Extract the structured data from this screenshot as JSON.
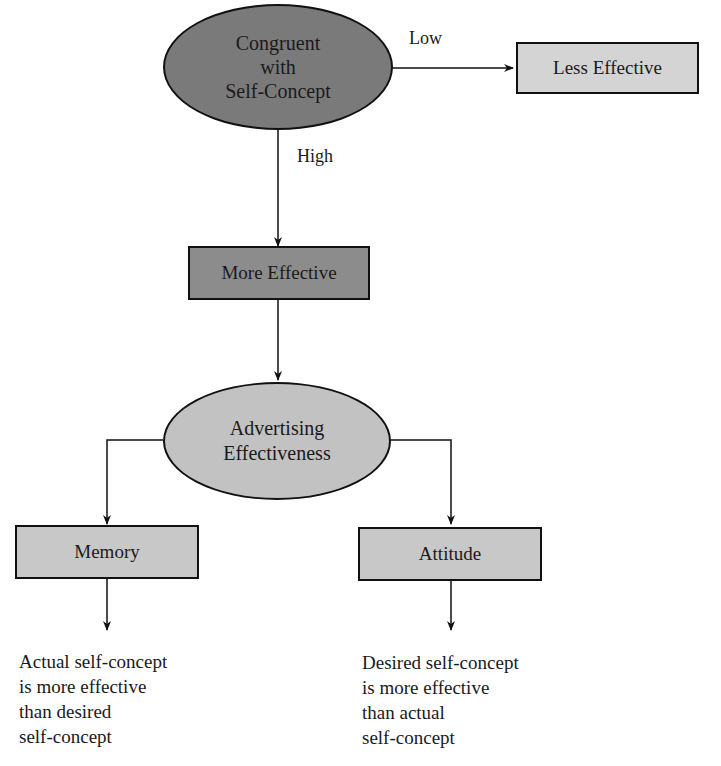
{
  "nodes": {
    "congruent": {
      "label_lines": [
        "Congruent",
        "with",
        "Self-Concept"
      ],
      "fill": "#7a7a7a"
    },
    "less_effective": {
      "label": "Less Effective",
      "fill": "#d4d4d4"
    },
    "more_effective": {
      "label": "More Effective",
      "fill": "#8c8c8c"
    },
    "advertising": {
      "label_lines": [
        "Advertising",
        "Effectiveness"
      ],
      "fill": "#c2c2c2"
    },
    "memory": {
      "label": "Memory",
      "fill": "#c8c8c8"
    },
    "attitude": {
      "label": "Attitude",
      "fill": "#c8c8c8"
    }
  },
  "edge_labels": {
    "low": "Low",
    "high": "High"
  },
  "outcomes": {
    "memory": [
      "Actual self-concept",
      "is more effective",
      "than desired",
      "self-concept"
    ],
    "attitude": [
      "Desired self-concept",
      "is more effective",
      "than actual",
      "self-concept"
    ]
  }
}
